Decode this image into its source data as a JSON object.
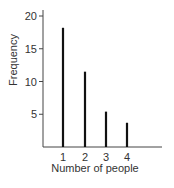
{
  "chart_data": {
    "type": "bar",
    "title": "",
    "xlabel": "Number of people",
    "ylabel": "Frequency",
    "categories": [
      "1",
      "2",
      "3",
      "4"
    ],
    "values": [
      18.2,
      11.5,
      5.4,
      3.7
    ],
    "yticks": [
      5,
      10,
      15,
      20
    ],
    "ylim": [
      0,
      21
    ],
    "grid": false,
    "legend": "none",
    "style": "thin vertical line bars (stick plot)"
  }
}
